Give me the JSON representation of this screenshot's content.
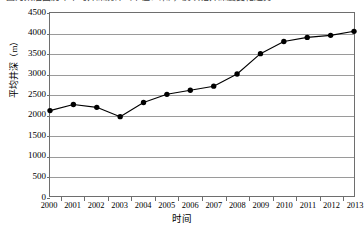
{
  "figure": {
    "top_caption": "图为某油田历年平均井深统计（单位：米），反映钻井深度变化趋势"
  },
  "chart_data": {
    "type": "line",
    "title": "",
    "xlabel": "时间",
    "ylabel": "平均井深（m）",
    "categories": [
      "2000",
      "2001",
      "2002",
      "2003",
      "2004",
      "2005",
      "2006",
      "2007",
      "2008",
      "2009",
      "2010",
      "2011",
      "2012",
      "2013"
    ],
    "values": [
      2100,
      2250,
      2180,
      1950,
      2300,
      2500,
      2600,
      2700,
      3000,
      3500,
      3800,
      3900,
      3950,
      4050
    ],
    "series": [
      {
        "name": "平均井深",
        "values": [
          2100,
          2250,
          2180,
          1950,
          2300,
          2500,
          2600,
          2700,
          3000,
          3500,
          3800,
          3900,
          3950,
          4050
        ]
      }
    ],
    "ylim": [
      0,
      4500
    ],
    "ytick_step": 500,
    "yticks": [
      "4500",
      "4000",
      "3500",
      "3000",
      "2500",
      "2000",
      "1500",
      "1000",
      "500",
      "0"
    ],
    "ytick_values": [
      4500,
      4000,
      3500,
      3000,
      2500,
      2000,
      1500,
      1000,
      500,
      0
    ],
    "grid": true,
    "grid_axis": "y",
    "legend": "none",
    "marker": "filled-circle",
    "line_color": "#000000",
    "marker_color": "#000000",
    "grid_color": "#9a9a9a",
    "axis_color": "#6e6e6e",
    "background": "#ffffff"
  }
}
